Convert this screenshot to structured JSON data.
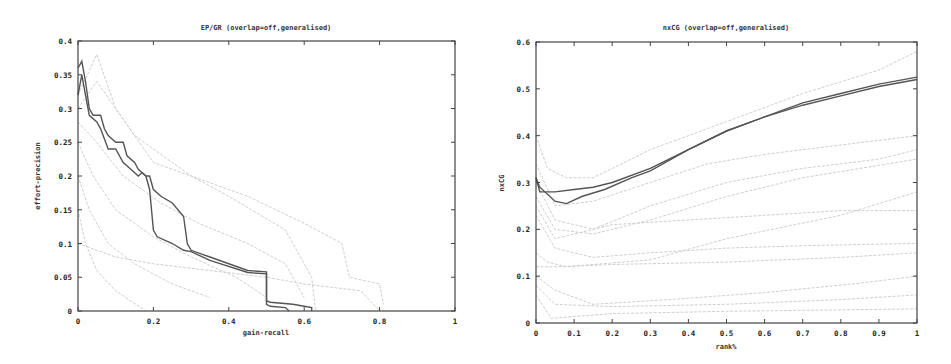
{
  "chart_data": [
    {
      "type": "line",
      "title": "EP/GR (overlap=off,generalised)",
      "xlabel": "gain-recall",
      "ylabel": "effort-precision",
      "xlim": [
        0,
        1
      ],
      "ylim": [
        0,
        0.4
      ],
      "xticks": [
        "0",
        "0.2",
        "0.4",
        "0.6",
        "0.8",
        "1"
      ],
      "yticks": [
        "0",
        "0.05",
        "0.1",
        "0.15",
        "0.2",
        "0.25",
        "0.3",
        "0.35",
        "0.4"
      ],
      "grid": false,
      "legend": null,
      "series": [
        {
          "name": "highlighted-run-1",
          "style": "main",
          "x": [
            0.0,
            0.01,
            0.02,
            0.03,
            0.04,
            0.06,
            0.07,
            0.08,
            0.1,
            0.12,
            0.13,
            0.15,
            0.16,
            0.18,
            0.19,
            0.2,
            0.22,
            0.25,
            0.28,
            0.29,
            0.3,
            0.35,
            0.45,
            0.5,
            0.5,
            0.51,
            0.57,
            0.6,
            0.62,
            0.62
          ],
          "y": [
            0.36,
            0.37,
            0.34,
            0.3,
            0.29,
            0.29,
            0.27,
            0.26,
            0.25,
            0.25,
            0.23,
            0.22,
            0.21,
            0.2,
            0.2,
            0.18,
            0.17,
            0.16,
            0.14,
            0.1,
            0.09,
            0.08,
            0.06,
            0.058,
            0.015,
            0.013,
            0.01,
            0.007,
            0.005,
            0.0
          ]
        },
        {
          "name": "highlighted-run-2",
          "style": "main",
          "x": [
            0.0,
            0.01,
            0.02,
            0.03,
            0.05,
            0.06,
            0.08,
            0.1,
            0.12,
            0.14,
            0.16,
            0.17,
            0.18,
            0.19,
            0.2,
            0.21,
            0.25,
            0.28,
            0.3,
            0.35,
            0.45,
            0.5,
            0.5,
            0.51,
            0.55,
            0.56
          ],
          "y": [
            0.32,
            0.35,
            0.32,
            0.29,
            0.28,
            0.27,
            0.24,
            0.24,
            0.22,
            0.21,
            0.2,
            0.205,
            0.2,
            0.18,
            0.12,
            0.11,
            0.1,
            0.09,
            0.088,
            0.075,
            0.057,
            0.055,
            0.01,
            0.007,
            0.005,
            0.0
          ]
        },
        {
          "name": "other-run-a",
          "style": "faint",
          "x": [
            0.0,
            0.05,
            0.15,
            0.3,
            0.45,
            0.6,
            0.7,
            0.72,
            0.8,
            0.81
          ],
          "y": [
            0.3,
            0.34,
            0.26,
            0.2,
            0.17,
            0.13,
            0.1,
            0.05,
            0.04,
            0.01
          ]
        },
        {
          "name": "other-run-b",
          "style": "faint",
          "x": [
            0.0,
            0.05,
            0.1,
            0.2,
            0.3,
            0.4,
            0.55,
            0.62,
            0.63
          ],
          "y": [
            0.32,
            0.38,
            0.3,
            0.22,
            0.2,
            0.17,
            0.12,
            0.05,
            0.0
          ]
        },
        {
          "name": "other-run-c",
          "style": "faint",
          "x": [
            0.0,
            0.05,
            0.12,
            0.22,
            0.32,
            0.45,
            0.55,
            0.6
          ],
          "y": [
            0.28,
            0.25,
            0.2,
            0.16,
            0.13,
            0.1,
            0.07,
            0.02
          ]
        },
        {
          "name": "other-run-d",
          "style": "faint",
          "x": [
            0.0,
            0.04,
            0.1,
            0.2,
            0.3,
            0.42,
            0.5
          ],
          "y": [
            0.25,
            0.2,
            0.15,
            0.11,
            0.08,
            0.05,
            0.02
          ]
        },
        {
          "name": "other-run-e",
          "style": "faint",
          "x": [
            0.0,
            0.03,
            0.08,
            0.15,
            0.25,
            0.35
          ],
          "y": [
            0.2,
            0.15,
            0.1,
            0.07,
            0.04,
            0.02
          ]
        },
        {
          "name": "other-run-f",
          "style": "faint",
          "x": [
            0.0,
            0.02,
            0.05,
            0.1,
            0.18
          ],
          "y": [
            0.15,
            0.1,
            0.06,
            0.03,
            0.0
          ]
        },
        {
          "name": "other-run-g",
          "style": "faint",
          "x": [
            0.0,
            0.1,
            0.2,
            0.35,
            0.5,
            0.6,
            0.75,
            0.8
          ],
          "y": [
            0.1,
            0.08,
            0.07,
            0.06,
            0.05,
            0.04,
            0.03,
            0.0
          ]
        }
      ]
    },
    {
      "type": "line",
      "title": "nxCG (overlap=off,generalised)",
      "xlabel": "rank%",
      "ylabel": "nxCG",
      "xlim": [
        0,
        1
      ],
      "ylim": [
        0,
        0.6
      ],
      "xticks": [
        "0",
        "0.1",
        "0.2",
        "0.3",
        "0.4",
        "0.5",
        "0.6",
        "0.7",
        "0.8",
        "0.9",
        "1"
      ],
      "yticks": [
        "0",
        "0.1",
        "0.2",
        "0.3",
        "0.4",
        "0.5",
        "0.6"
      ],
      "grid": false,
      "legend": null,
      "series": [
        {
          "name": "highlighted-run-1",
          "style": "main",
          "x": [
            0.0,
            0.01,
            0.05,
            0.1,
            0.15,
            0.2,
            0.3,
            0.4,
            0.5,
            0.6,
            0.7,
            0.8,
            0.9,
            1.0
          ],
          "y": [
            0.31,
            0.28,
            0.28,
            0.285,
            0.29,
            0.3,
            0.33,
            0.37,
            0.41,
            0.44,
            0.47,
            0.49,
            0.51,
            0.525
          ]
        },
        {
          "name": "highlighted-run-2",
          "style": "main",
          "x": [
            0.0,
            0.01,
            0.05,
            0.08,
            0.12,
            0.18,
            0.25,
            0.3,
            0.4,
            0.5,
            0.6,
            0.7,
            0.8,
            0.9,
            1.0
          ],
          "y": [
            0.31,
            0.29,
            0.26,
            0.255,
            0.27,
            0.285,
            0.31,
            0.325,
            0.37,
            0.41,
            0.44,
            0.465,
            0.485,
            0.505,
            0.52
          ]
        },
        {
          "name": "other-run-a",
          "style": "faint",
          "x": [
            0.0,
            0.03,
            0.08,
            0.15,
            0.3,
            0.5,
            0.7,
            0.9,
            1.0
          ],
          "y": [
            0.4,
            0.33,
            0.31,
            0.31,
            0.37,
            0.43,
            0.49,
            0.54,
            0.58
          ]
        },
        {
          "name": "other-run-b",
          "style": "faint",
          "x": [
            0.0,
            0.05,
            0.15,
            0.3,
            0.45,
            0.6,
            0.8,
            1.0
          ],
          "y": [
            0.34,
            0.25,
            0.26,
            0.3,
            0.34,
            0.36,
            0.38,
            0.4
          ]
        },
        {
          "name": "other-run-c",
          "style": "faint",
          "x": [
            0.0,
            0.05,
            0.15,
            0.3,
            0.5,
            0.7,
            0.9,
            1.0
          ],
          "y": [
            0.3,
            0.22,
            0.2,
            0.25,
            0.3,
            0.33,
            0.35,
            0.37
          ]
        },
        {
          "name": "other-run-d",
          "style": "faint",
          "x": [
            0.0,
            0.05,
            0.15,
            0.3,
            0.5,
            0.7,
            1.0
          ],
          "y": [
            0.27,
            0.2,
            0.19,
            0.22,
            0.27,
            0.31,
            0.35
          ]
        },
        {
          "name": "other-run-e",
          "style": "faint",
          "x": [
            0.0,
            0.05,
            0.2,
            0.4,
            0.6,
            0.8,
            1.0
          ],
          "y": [
            0.25,
            0.18,
            0.21,
            0.22,
            0.23,
            0.24,
            0.24
          ]
        },
        {
          "name": "other-run-f",
          "style": "faint",
          "x": [
            0.0,
            0.05,
            0.15,
            0.3,
            0.5,
            0.7,
            1.0
          ],
          "y": [
            0.23,
            0.16,
            0.14,
            0.15,
            0.16,
            0.165,
            0.17
          ]
        },
        {
          "name": "other-run-g",
          "style": "faint",
          "x": [
            0.0,
            0.03,
            0.08,
            0.15,
            0.3,
            0.5,
            0.8,
            1.0
          ],
          "y": [
            0.15,
            0.13,
            0.12,
            0.125,
            0.135,
            0.18,
            0.23,
            0.28
          ]
        },
        {
          "name": "other-run-h",
          "style": "faint",
          "x": [
            0.0,
            0.05,
            0.2,
            0.5,
            0.8,
            1.0
          ],
          "y": [
            0.12,
            0.12,
            0.125,
            0.13,
            0.14,
            0.15
          ]
        },
        {
          "name": "other-run-i",
          "style": "faint",
          "x": [
            0.0,
            0.05,
            0.15,
            0.35,
            0.6,
            0.85,
            1.0
          ],
          "y": [
            0.1,
            0.07,
            0.04,
            0.05,
            0.065,
            0.085,
            0.1
          ]
        },
        {
          "name": "other-run-j",
          "style": "faint",
          "x": [
            0.0,
            0.05,
            0.2,
            0.5,
            0.8,
            1.0
          ],
          "y": [
            0.08,
            0.04,
            0.035,
            0.04,
            0.05,
            0.06
          ]
        },
        {
          "name": "other-run-k",
          "style": "faint",
          "x": [
            0.0,
            0.04,
            0.2,
            0.5,
            1.0
          ],
          "y": [
            0.06,
            0.01,
            0.02,
            0.025,
            0.03
          ]
        }
      ]
    }
  ]
}
